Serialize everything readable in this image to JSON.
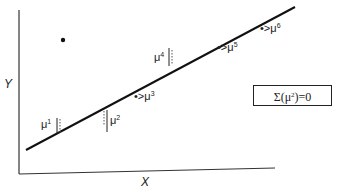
{
  "diagram": {
    "axes": {
      "x_label": "X",
      "y_label": "Y"
    },
    "regression_line": {
      "from": [
        26,
        150
      ],
      "to": [
        295,
        7
      ]
    },
    "outlier_point": [
      63,
      40
    ],
    "residuals": [
      {
        "id": "mu1",
        "symbol": "μ",
        "index": "1",
        "side": "below",
        "marker": "dashed-bracket"
      },
      {
        "id": "mu2",
        "symbol": "μ",
        "index": "2",
        "side": "below",
        "marker": "dashed-bracket"
      },
      {
        "id": "mu3",
        "symbol": "μ",
        "index": "3",
        "side": "on-line",
        "marker": "dot-arrow"
      },
      {
        "id": "mu4",
        "symbol": "μ",
        "index": "4",
        "side": "above",
        "marker": "dashed-bracket"
      },
      {
        "id": "mu5",
        "symbol": "μ",
        "index": "5",
        "side": "on-line",
        "marker": "dot-arrow"
      },
      {
        "id": "mu6",
        "symbol": "μ",
        "index": "6",
        "side": "on-line",
        "marker": "dot-arrow"
      }
    ],
    "annotation": {
      "prefix": "Σ(μ",
      "exponent": "2",
      "suffix": ") = 0"
    }
  },
  "labels": {
    "mu1": "μ",
    "mu1_sup": "1",
    "mu2": "μ",
    "mu2_sup": "2",
    "mu3": "•>μ",
    "mu3_sup": "3",
    "mu4": "μ",
    "mu4_sup": "4",
    "mu5": "•>μ",
    "mu5_sup": "5",
    "mu6": "•>μ",
    "mu6_sup": "6",
    "x_axis": "X",
    "y_axis": "Y",
    "sum_prefix": "Σ(μ",
    "sum_exp": "2",
    "sum_suffix": ")=0"
  }
}
